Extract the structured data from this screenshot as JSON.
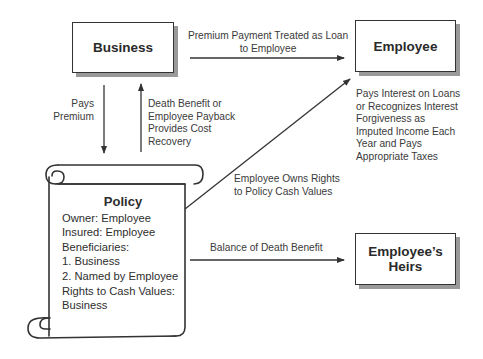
{
  "nodes": {
    "business": {
      "label": "Business"
    },
    "employee": {
      "label": "Employee"
    },
    "heirs": {
      "label_line1": "Employee’s",
      "label_line2": "Heirs"
    }
  },
  "policy": {
    "title": "Policy",
    "lines": [
      "Owner: Employee",
      "Insured: Employee",
      "Beneficiaries:",
      "1. Business",
      "2. Named by Employee",
      "Rights to Cash Values:",
      "Business"
    ]
  },
  "edges": {
    "business_to_employee": [
      "Premium Payment Treated as Loan",
      "to Employee"
    ],
    "business_to_policy": [
      "Pays",
      "Premium"
    ],
    "policy_to_business": [
      "Death Benefit or",
      "Employee Payback",
      "Provides Cost",
      "Recovery"
    ],
    "policy_to_employee": [
      "Employee Owns Rights",
      "to Policy Cash Values"
    ],
    "policy_to_heirs": [
      "Balance of Death Benefit"
    ]
  },
  "annotations": {
    "employee_note": [
      "Pays Interest on Loans",
      "or Recognizes Interest",
      "Forgiveness as",
      "Imputed Income Each",
      "Year and Pays",
      "Appropriate Taxes"
    ]
  }
}
